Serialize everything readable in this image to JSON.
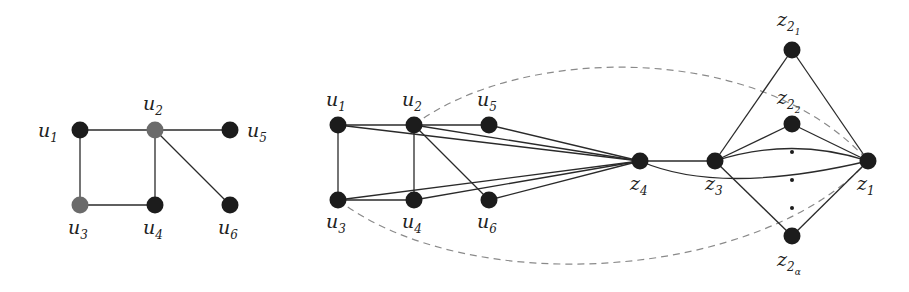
{
  "figure": {
    "left_graph": {
      "nodes": [
        {
          "id": "u1",
          "label": "u",
          "sub": "1",
          "x": 80,
          "y": 130,
          "color": "#1c1c1c",
          "lx": 38,
          "ly": 137
        },
        {
          "id": "u2",
          "label": "u",
          "sub": "2",
          "x": 155,
          "y": 130,
          "color": "#6b6b6b",
          "lx": 143,
          "ly": 110
        },
        {
          "id": "u5",
          "label": "u",
          "sub": "5",
          "x": 230,
          "y": 130,
          "color": "#1c1c1c",
          "lx": 247,
          "ly": 137
        },
        {
          "id": "u3",
          "label": "u",
          "sub": "3",
          "x": 80,
          "y": 205,
          "color": "#6b6b6b",
          "lx": 68,
          "ly": 234
        },
        {
          "id": "u4",
          "label": "u",
          "sub": "4",
          "x": 155,
          "y": 205,
          "color": "#1c1c1c",
          "lx": 143,
          "ly": 234
        },
        {
          "id": "u6",
          "label": "u",
          "sub": "6",
          "x": 230,
          "y": 205,
          "color": "#1c1c1c",
          "lx": 218,
          "ly": 234
        }
      ],
      "edges": [
        [
          "u1",
          "u2"
        ],
        [
          "u2",
          "u5"
        ],
        [
          "u1",
          "u3"
        ],
        [
          "u3",
          "u4"
        ],
        [
          "u2",
          "u4"
        ],
        [
          "u2",
          "u6"
        ]
      ]
    },
    "right_graph": {
      "nodes": [
        {
          "id": "u1",
          "label": "u",
          "sub": "1",
          "x": 338,
          "y": 125,
          "color": "#1c1c1c",
          "lx": 326,
          "ly": 106
        },
        {
          "id": "u2",
          "label": "u",
          "sub": "2",
          "x": 414,
          "y": 125,
          "color": "#1c1c1c",
          "lx": 402,
          "ly": 106
        },
        {
          "id": "u5",
          "label": "u",
          "sub": "5",
          "x": 489,
          "y": 125,
          "color": "#1c1c1c",
          "lx": 477,
          "ly": 106
        },
        {
          "id": "u3",
          "label": "u",
          "sub": "3",
          "x": 338,
          "y": 200,
          "color": "#1c1c1c",
          "lx": 326,
          "ly": 228
        },
        {
          "id": "u4",
          "label": "u",
          "sub": "4",
          "x": 414,
          "y": 200,
          "color": "#1c1c1c",
          "lx": 402,
          "ly": 228
        },
        {
          "id": "u6",
          "label": "u",
          "sub": "6",
          "x": 489,
          "y": 200,
          "color": "#1c1c1c",
          "lx": 477,
          "ly": 228
        },
        {
          "id": "z4",
          "label": "z",
          "sub": "4",
          "x": 640,
          "y": 161,
          "color": "#1c1c1c",
          "lx": 630,
          "ly": 190
        },
        {
          "id": "z3",
          "label": "z",
          "sub": "3",
          "x": 715,
          "y": 161,
          "color": "#1c1c1c",
          "lx": 705,
          "ly": 190
        },
        {
          "id": "z1",
          "label": "z",
          "sub": "1",
          "x": 868,
          "y": 161,
          "color": "#1c1c1c",
          "lx": 857,
          "ly": 190
        },
        {
          "id": "z21",
          "label": "z",
          "sub": "2",
          "subsub": "1",
          "x": 792,
          "y": 50,
          "color": "#1c1c1c",
          "lx": 777,
          "ly": 26
        },
        {
          "id": "z22",
          "label": "z",
          "sub": "2",
          "subsub": "2",
          "x": 792,
          "y": 124,
          "color": "#1c1c1c",
          "lx": 777,
          "ly": 104
        },
        {
          "id": "z2a",
          "label": "z",
          "sub": "2",
          "subsub": "α",
          "x": 792,
          "y": 236,
          "color": "#1c1c1c",
          "lx": 777,
          "ly": 266
        }
      ],
      "edges": [
        [
          "u1",
          "u2"
        ],
        [
          "u2",
          "u5"
        ],
        [
          "u1",
          "u3"
        ],
        [
          "u3",
          "u4"
        ],
        [
          "u2",
          "u4"
        ],
        [
          "u2",
          "u6"
        ],
        [
          "u1",
          "z4"
        ],
        [
          "u2",
          "z4"
        ],
        [
          "u5",
          "z4"
        ],
        [
          "u3",
          "z4"
        ],
        [
          "u4",
          "z4"
        ],
        [
          "u6",
          "z4"
        ],
        [
          "z4",
          "z3"
        ],
        [
          "z3",
          "z21"
        ],
        [
          "z3",
          "z22"
        ],
        [
          "z3",
          "z2a"
        ],
        [
          "z21",
          "z1"
        ],
        [
          "z22",
          "z1"
        ],
        [
          "z2a",
          "z1"
        ]
      ],
      "curved_edges": [
        {
          "from": "z3",
          "to": "z1",
          "path": "M715,161 Q792,136 868,161"
        },
        {
          "from": "z4",
          "to": "z1",
          "path": "M640,161 Q720,196 868,161"
        }
      ],
      "dashed_curves": [
        {
          "from": "u2",
          "to": "z1",
          "path": "M414,125 C520,45 760,40 868,161"
        },
        {
          "from": "u3",
          "to": "z1",
          "path": "M338,200 C470,300 760,280 868,161"
        }
      ],
      "ellipsis_dots": [
        {
          "x": 792,
          "y": 152
        },
        {
          "x": 792,
          "y": 180
        },
        {
          "x": 792,
          "y": 208
        }
      ]
    }
  }
}
